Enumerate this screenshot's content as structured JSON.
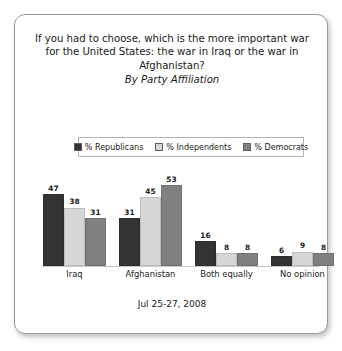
{
  "card": {
    "accent_dark": "#333333",
    "accent_light": "#d6d6d6",
    "accent_medium": "#808080",
    "border_color": "#9a9a9a"
  },
  "title": "If you had to choose, which is the more important war for the United States: the war in Iraq or the war in Afghanistan?",
  "subtitle": "By Party Affiliation",
  "footer": {
    "date": "Jul 25-27, 2008"
  },
  "legend": {
    "items": [
      {
        "label": "% Republicans",
        "color": "#333333"
      },
      {
        "label": "% Independents",
        "color": "#d6d6d6"
      },
      {
        "label": "% Democrats",
        "color": "#808080"
      }
    ]
  },
  "chart_data": {
    "type": "bar",
    "title": "If you had to choose, which is the more important war for the United States: the war in Iraq or the war in Afghanistan?",
    "subtitle": "By Party Affiliation",
    "xlabel": "",
    "ylabel": "",
    "ylim": [
      0,
      60
    ],
    "grid": false,
    "legend_position": "top",
    "categories": [
      "Iraq",
      "Afghanistan",
      "Both equally",
      "No opinion"
    ],
    "series": [
      {
        "name": "% Republicans",
        "color": "#333333",
        "values": [
          47,
          31,
          16,
          6
        ]
      },
      {
        "name": "% Independents",
        "color": "#d6d6d6",
        "values": [
          38,
          45,
          8,
          9
        ]
      },
      {
        "name": "% Democrats",
        "color": "#808080",
        "values": [
          31,
          53,
          8,
          8
        ]
      }
    ],
    "annotation": "Jul 25-27, 2008"
  }
}
